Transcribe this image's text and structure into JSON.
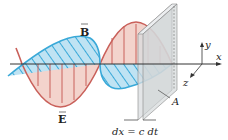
{
  "labels": {
    "B": "B",
    "E": "E",
    "x": "x",
    "y": "y",
    "z": "z",
    "A": "A",
    "dx": "dx = c dt"
  },
  "colors": {
    "e_field": "#c9605a",
    "e_fill": "#f3d3cc",
    "b_field": "#3aa9d8",
    "b_fill": "#bfe3f3",
    "plane": "#d9dcdf",
    "axis": "#333333"
  }
}
